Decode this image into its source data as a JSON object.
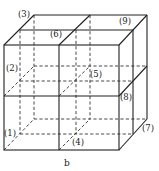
{
  "diagram": {
    "caption": "b",
    "labels": [
      {
        "id": "1",
        "text": "(1)",
        "x": 4,
        "y": 136
      },
      {
        "id": "2",
        "text": "(2)",
        "x": 6,
        "y": 71
      },
      {
        "id": "3",
        "text": "(3)",
        "x": 18,
        "y": 17
      },
      {
        "id": "4",
        "text": "(4)",
        "x": 72,
        "y": 145
      },
      {
        "id": "5",
        "text": "(5)",
        "x": 90,
        "y": 77
      },
      {
        "id": "6",
        "text": "(6)",
        "x": 50,
        "y": 37
      },
      {
        "id": "7",
        "text": "(7)",
        "x": 142,
        "y": 131
      },
      {
        "id": "8",
        "text": "(8)",
        "x": 120,
        "y": 100
      },
      {
        "id": "9",
        "text": "(9)",
        "x": 119,
        "y": 24
      }
    ]
  }
}
